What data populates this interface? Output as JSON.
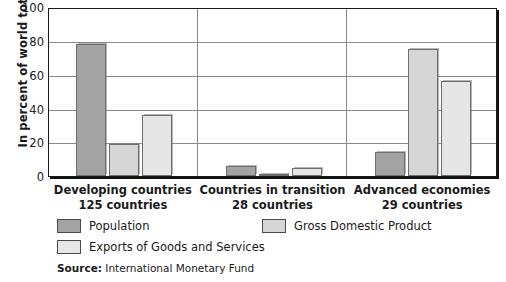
{
  "chart_data": {
    "type": "bar",
    "title": "",
    "xlabel": "",
    "ylabel": "In percent of world total",
    "ylim": [
      0,
      100
    ],
    "yticks": [
      100,
      80,
      60,
      40,
      20,
      0
    ],
    "grid": true,
    "legend_position": "below-plot",
    "categories": [
      "Developing countries",
      "Countries in transition",
      "Advanced economies"
    ],
    "category_sublabels": [
      "125 countries",
      "28 countries",
      "29 countries"
    ],
    "series": [
      {
        "name": "Population",
        "color": "#a3a3a3",
        "values": [
          78,
          6,
          14
        ]
      },
      {
        "name": "Gross Domestic Product",
        "color": "#d6d6d6",
        "values": [
          19,
          1,
          75
        ]
      },
      {
        "name": "Exports of Goods and Services",
        "color": "#e6e6e6",
        "values": [
          36,
          5,
          56
        ]
      }
    ],
    "source_prefix": "Source:",
    "source_text": "International Monetary Fund"
  },
  "legend": {
    "items": [
      {
        "label": "Population",
        "color": "#a3a3a3"
      },
      {
        "label": "Gross Domestic Product",
        "color": "#d6d6d6"
      },
      {
        "label": "Exports of Goods and Services",
        "color": "#e6e6e6"
      }
    ]
  },
  "axis": {
    "y_title": "In percent of world total",
    "tick_100": "100",
    "tick_80": "80",
    "tick_60": "60",
    "tick_40": "40",
    "tick_20": "20",
    "tick_0": "0"
  },
  "source": {
    "prefix": "Source:",
    "text": " International Monetary Fund"
  }
}
